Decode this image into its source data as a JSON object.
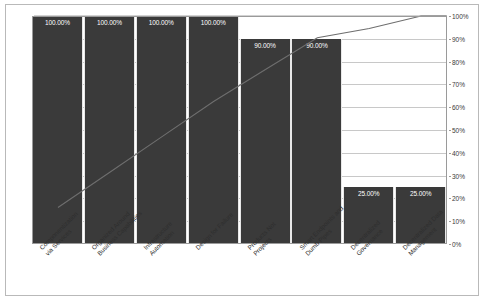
{
  "chart_data": {
    "type": "bar",
    "title": "",
    "subtitle": "",
    "xlabel": "",
    "ylabel": "",
    "ylim": [
      0,
      100
    ],
    "grid": true,
    "legend": "none",
    "categories": [
      "Componentization via Services",
      "Organized Around Business Capabilities",
      "Infrastructure Automation",
      "Design for Failure",
      "Products Not Projects",
      "Smart Endpoints and Dumb Pipes",
      "Decentralized Governance",
      "Decentralized Data Management"
    ],
    "category_lines": [
      [
        "Componentization",
        "via Services"
      ],
      [
        "Organized Around",
        "Business Capabilities"
      ],
      [
        "Infrastructure",
        "Automation"
      ],
      [
        "Design for Failure"
      ],
      [
        "Products Not",
        "Projects"
      ],
      [
        "Smart Endpoints and",
        "Dumb Pipes"
      ],
      [
        "Decentralized",
        "Governance"
      ],
      [
        "Decentralized Data",
        "Management"
      ]
    ],
    "values": [
      100.0,
      100.0,
      100.0,
      100.0,
      90.0,
      90.0,
      25.0,
      25.0
    ],
    "value_labels": [
      "100.00%",
      "100.00%",
      "100.00%",
      "100.00%",
      "90.00%",
      "90.00%",
      "25.00%",
      "25.00%"
    ],
    "series": [
      {
        "name": "Frequency",
        "type": "bar",
        "values": [
          100.0,
          100.0,
          100.0,
          100.0,
          90.0,
          90.0,
          25.0,
          25.0
        ]
      },
      {
        "name": "Cumulative",
        "type": "line",
        "values": [
          16.0,
          31.5,
          47.0,
          62.5,
          76.5,
          90.5,
          94.5,
          100.0
        ]
      }
    ],
    "zero_label": "0.00%",
    "ytick_labels": [
      "100%",
      "90%",
      "80%",
      "70%",
      "60%",
      "50%",
      "40%",
      "30%",
      "20%",
      "10%",
      "0%"
    ],
    "ytick_values": [
      100,
      90,
      80,
      70,
      60,
      50,
      40,
      30,
      20,
      10,
      0
    ],
    "colors": {
      "bar": "#3a3a3a",
      "line": "#6e6e6e",
      "grid": "#c8c8c8",
      "axis": "#9a9a9a",
      "bar_label_text": "#ffffff",
      "axis_text": "#3a3a3a",
      "background": "#ffffff",
      "frame": "#b9b9b9"
    }
  }
}
